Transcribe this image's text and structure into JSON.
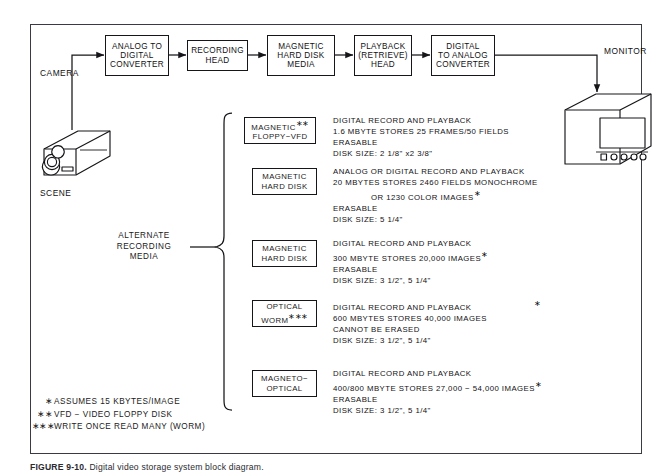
{
  "figure": {
    "caption_label": "FIGURE 9-10.",
    "caption_text": "Digital video storage system block diagram."
  },
  "flow": {
    "camera_label": "CAMERA",
    "scene_label": "SCENE",
    "monitor_label": "MONITOR",
    "boxes": [
      {
        "name": "analog-to-digital-converter",
        "lines": [
          "ANALOG TO",
          "DIGITAL",
          "CONVERTER"
        ]
      },
      {
        "name": "recording-head",
        "lines": [
          "RECORDING",
          "HEAD"
        ]
      },
      {
        "name": "magnetic-hard-disk-media",
        "lines": [
          "MAGNETIC",
          "HARD  DISK",
          "MEDIA"
        ]
      },
      {
        "name": "playback-retrieve-head",
        "lines": [
          "PLAYBACK",
          "(RETRIEVE)",
          "HEAD"
        ]
      },
      {
        "name": "digital-to-analog-converter",
        "lines": [
          "DIGITAL",
          "TO  ANALOG",
          "CONVERTER"
        ]
      }
    ]
  },
  "alternate_media": {
    "label_lines": [
      "ALTERNATE",
      "RECORDING",
      "MEDIA"
    ],
    "items": [
      {
        "name": "magnetic-floppy-vfd",
        "title_lines": [
          "MAGNETIC",
          "FLOPPY−VFD"
        ],
        "title_marker": "∗∗",
        "marker_line": 0,
        "desc_lines": [
          "DIGITAL  RECORD  AND  PLAYBACK",
          "1.6  MBYTE  STORES  25  FRAMES/50  FIELDS",
          "ERASABLE",
          "DISK  SIZE:  2  1/8\" x2  3/8\""
        ],
        "desc_marked": []
      },
      {
        "name": "magnetic-hard-disk-20mb",
        "title_lines": [
          "MAGNETIC",
          "HARD  DISK"
        ],
        "title_marker": "",
        "marker_line": -1,
        "desc_lines": [
          "ANALOG  OR  DIGITAL  RECORD  AND  PLAYBACK",
          "20  MBYTES  STORES  2460  FIELDS  MONOCHROME",
          "OR  1230  COLOR  IMAGES",
          "ERASABLE",
          "DISK  SIZE:  5  1/4\""
        ],
        "desc_marked": [
          2
        ],
        "desc_indented": [
          2
        ]
      },
      {
        "name": "magnetic-hard-disk-300mb",
        "title_lines": [
          "MAGNETIC",
          "HARD  DISK"
        ],
        "title_marker": "",
        "marker_line": -1,
        "desc_lines": [
          "DIGITAL  RECORD  AND  PLAYBACK",
          "300  MBYTE  STORES  20,000  IMAGES",
          "ERASABLE",
          "DISK  SIZE:  3  1/2\",  5  1/4\""
        ],
        "desc_marked": [
          1
        ]
      },
      {
        "name": "optical-worm",
        "title_lines": [
          "OPTICAL",
          "WORM"
        ],
        "title_marker": "∗∗∗",
        "marker_line": 1,
        "desc_lines": [
          "DIGITAL  RECORD  AND  PLAYBACK",
          "600  MBYTES  STORES  40,000  IMAGES",
          "CANNOT  BE  ERASED",
          "DISK  SIZE:  3  1/2\",  5  1/4\""
        ],
        "desc_marked": [
          1
        ]
      },
      {
        "name": "magneto-optical",
        "title_lines": [
          "MAGNETO−",
          "OPTICAL"
        ],
        "title_marker": "",
        "marker_line": -1,
        "desc_lines": [
          "DIGITAL  RECORD  AND  PLAYBACK",
          "400/800  MBYTE  STORES  27,000  −  54,000  IMAGES",
          "ERASABLE",
          "DISK  SIZE:  3  1/2\",  5  1/4\""
        ],
        "desc_marked": [
          1
        ]
      }
    ]
  },
  "footnotes": [
    {
      "mark": "∗",
      "text": "ASSUMES  15  KBYTES/IMAGE"
    },
    {
      "mark": "∗∗",
      "text": "VFD  −  VIDEO  FLOPPY  DISK"
    },
    {
      "mark": "∗∗∗",
      "text": "WRITE  ONCE  READ  MANY  (WORM)"
    }
  ],
  "colors": {
    "ink": "#111114",
    "frame": "#3a3a42",
    "paper": "#ffffff"
  }
}
